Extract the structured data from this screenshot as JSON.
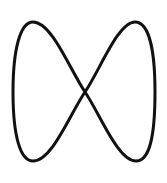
{
  "figure": {
    "shape": "figure-eight",
    "stroke_color": "#111111",
    "background_color": "#ffffff"
  }
}
